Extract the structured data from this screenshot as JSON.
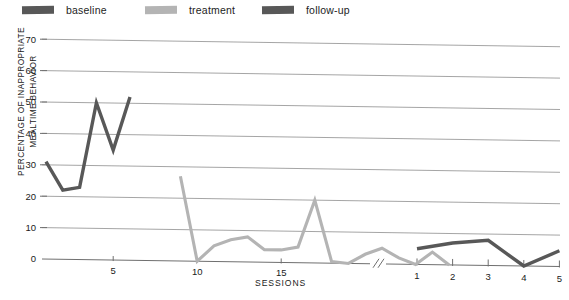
{
  "legend": {
    "items": [
      {
        "label": "baseline",
        "color": "#585858",
        "name": "legend-item-baseline"
      },
      {
        "label": "treatment",
        "color": "#b4b4b4",
        "name": "legend-item-treatment"
      },
      {
        "label": "follow-up",
        "color": "#585858",
        "name": "legend-item-followup"
      }
    ]
  },
  "chart_data": {
    "type": "line",
    "title": "",
    "subtitle": "",
    "xlabel": "SESSIONS",
    "ylabel": "PERCENTAGE OF INAPPROPRIATE MEALTIME BEHAVIOR",
    "ylim": [
      0,
      70
    ],
    "yticks": [
      0,
      10,
      20,
      30,
      40,
      50,
      60,
      70
    ],
    "ytick_labels": [
      "0",
      "10",
      "20",
      "30",
      "40",
      "50",
      "60",
      "70"
    ],
    "grid": true,
    "grid_axis": "y",
    "legend_position": "top",
    "axis_break": true,
    "axis_break_symbol": "//",
    "panels": [
      {
        "name": "sessions-main",
        "xticks": [
          5,
          10,
          15
        ],
        "xtick_labels": [
          "5",
          "10",
          "15"
        ],
        "xlim": [
          1,
          20
        ]
      },
      {
        "name": "sessions-followup",
        "xticks": [
          1,
          2,
          3,
          4,
          5
        ],
        "xtick_labels": [
          "1",
          "2",
          "3",
          "4",
          "5"
        ],
        "xlim": [
          1,
          5
        ]
      }
    ],
    "series": [
      {
        "name": "baseline",
        "color": "#585858",
        "panel": "sessions-main",
        "x": [
          1,
          2,
          3,
          4,
          5,
          6
        ],
        "values": [
          31,
          22,
          23,
          50,
          35,
          52
        ]
      },
      {
        "name": "treatment",
        "color": "#b4b4b4",
        "panel": "sessions-main",
        "x": [
          9,
          10,
          11,
          12,
          13,
          14,
          15,
          16,
          17,
          18,
          19,
          20,
          21,
          22,
          23,
          24,
          25
        ],
        "values": [
          27,
          0,
          5,
          7,
          8,
          4,
          4,
          5,
          20,
          0.5,
          0,
          3,
          5,
          2,
          0,
          4,
          0
        ]
      },
      {
        "name": "follow-up",
        "color": "#585858",
        "panel": "sessions-followup",
        "x": [
          1,
          2,
          3,
          4,
          5
        ],
        "values": [
          5,
          7,
          8,
          0,
          5
        ]
      }
    ]
  }
}
